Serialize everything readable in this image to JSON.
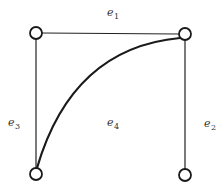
{
  "diagram": {
    "type": "graph",
    "nodes": [
      {
        "id": "v1",
        "position": "top-left",
        "cx": 36,
        "cy": 33
      },
      {
        "id": "v2",
        "position": "top-right",
        "cx": 185,
        "cy": 34
      },
      {
        "id": "v3",
        "position": "bottom-left",
        "cx": 36,
        "cy": 174
      },
      {
        "id": "v4",
        "position": "bottom-right",
        "cx": 185,
        "cy": 175
      }
    ],
    "edges": [
      {
        "id": "e1",
        "from": "v1",
        "to": "v2",
        "shape": "straight",
        "label": {
          "base": "e",
          "sub": "1"
        }
      },
      {
        "id": "e2",
        "from": "v2",
        "to": "v4",
        "shape": "straight",
        "label": {
          "base": "e",
          "sub": "2"
        }
      },
      {
        "id": "e3",
        "from": "v1",
        "to": "v3",
        "shape": "straight",
        "label": {
          "base": "e",
          "sub": "3"
        }
      },
      {
        "id": "e4",
        "from": "v3",
        "to": "v2",
        "shape": "curve",
        "label": {
          "base": "e",
          "sub": "4"
        }
      }
    ],
    "colors": {
      "stroke": "#1a1a1a",
      "background": "#ffffff",
      "label": "#333333"
    }
  }
}
